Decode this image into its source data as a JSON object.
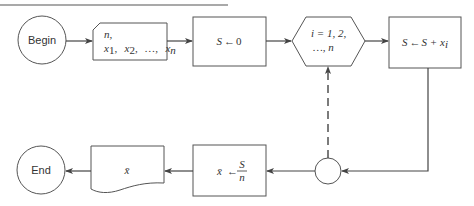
{
  "diagram": {
    "type": "flowchart",
    "nodes": {
      "begin": {
        "shape": "terminal-circle",
        "label": "Begin"
      },
      "input": {
        "shape": "input-card",
        "line1": "n,",
        "line2_x": "x",
        "sub1": "1",
        "sub2": "2",
        "subn": "n",
        "sep": ",",
        "ellipsis": "…,"
      },
      "init": {
        "shape": "process-box",
        "var": "S",
        "arrow": "←",
        "value": "0"
      },
      "loop": {
        "shape": "hexagon",
        "line1": "i = 1, 2,",
        "line2": "…, n"
      },
      "accumulate": {
        "shape": "process-box",
        "lhs": "S",
        "arrow": "←",
        "rhs": "S + x",
        "sub": "i"
      },
      "connector": {
        "shape": "connector-circle",
        "label": ""
      },
      "mean": {
        "shape": "process-box",
        "lhs": "x̄",
        "arrow": "←",
        "num": "S",
        "den": "n"
      },
      "output": {
        "shape": "document",
        "label": "x̄"
      },
      "end": {
        "shape": "terminal-circle",
        "label": "End"
      }
    },
    "edges": [
      {
        "from": "begin",
        "to": "input",
        "style": "solid"
      },
      {
        "from": "input",
        "to": "init",
        "style": "solid"
      },
      {
        "from": "init",
        "to": "loop",
        "style": "solid"
      },
      {
        "from": "loop",
        "to": "accumulate",
        "style": "solid"
      },
      {
        "from": "accumulate",
        "to": "connector",
        "style": "solid"
      },
      {
        "from": "connector",
        "to": "loop",
        "style": "dashed"
      },
      {
        "from": "connector",
        "to": "mean",
        "style": "solid"
      },
      {
        "from": "mean",
        "to": "output",
        "style": "solid"
      },
      {
        "from": "output",
        "to": "end",
        "style": "solid"
      }
    ]
  }
}
